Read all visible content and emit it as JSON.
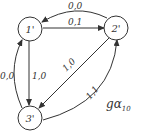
{
  "diagram": {
    "type": "state-transition-graph",
    "name": "gα",
    "name_subscript": "10",
    "nodes": [
      {
        "id": "1",
        "label": "1'"
      },
      {
        "id": "2",
        "label": "2'"
      },
      {
        "id": "3",
        "label": "3'"
      }
    ],
    "edges": [
      {
        "from": "2",
        "to": "1",
        "label": "0,0"
      },
      {
        "from": "1",
        "to": "2",
        "label": "0,1"
      },
      {
        "from": "1",
        "to": "3",
        "label": "1,0"
      },
      {
        "from": "3",
        "to": "1",
        "label": "0,0"
      },
      {
        "from": "2",
        "to": "3",
        "label": "1,0"
      },
      {
        "from": "3",
        "to": "2",
        "label": "1,1"
      }
    ]
  }
}
